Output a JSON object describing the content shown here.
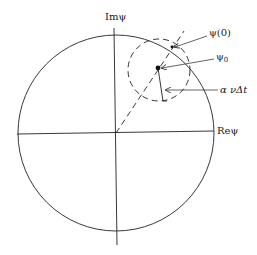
{
  "diagram": {
    "axes": {
      "imaginary_label": "Imψ",
      "real_label": "Reψ"
    },
    "annotations": {
      "psi_initial": "ψ(0)",
      "psi_zero_main": "ψ",
      "psi_zero_sub": "0",
      "step_radius": "α νΔt"
    },
    "colors": {
      "stroke": "#222222",
      "background": "#ffffff"
    }
  }
}
